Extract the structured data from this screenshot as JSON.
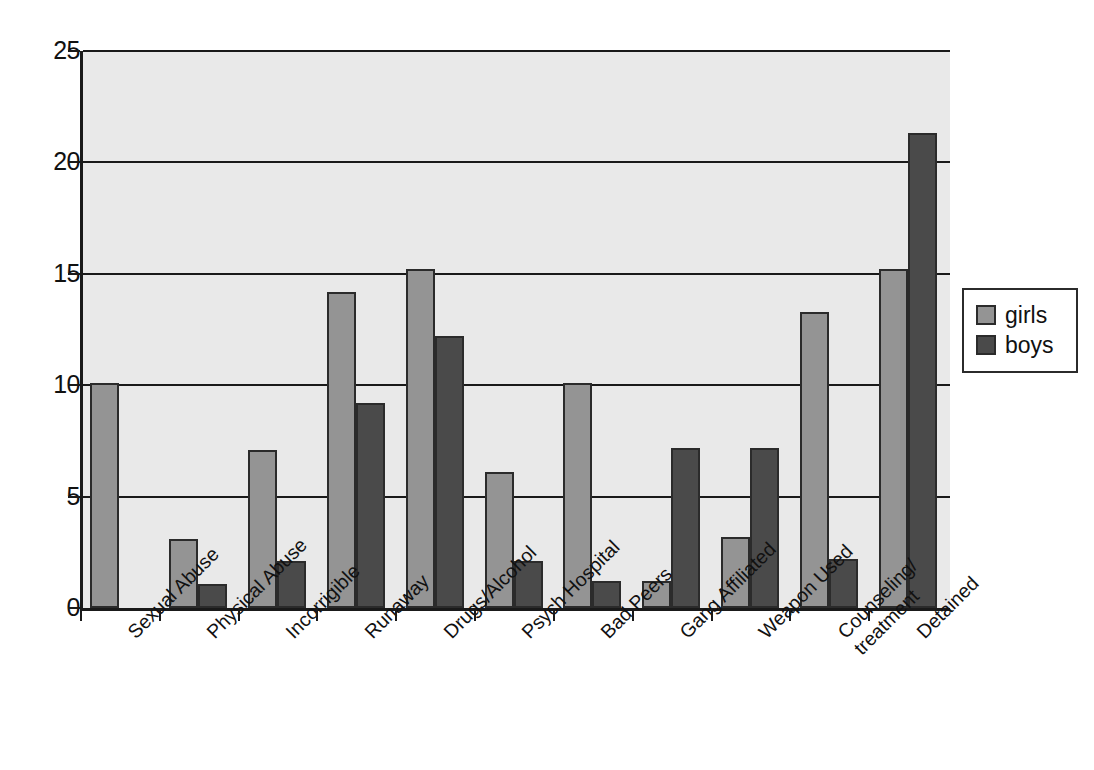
{
  "chart_data": {
    "type": "bar",
    "title": "",
    "subtitle": "",
    "xlabel": "",
    "ylabel": "",
    "ylim": [
      0,
      25
    ],
    "yticks": [
      0,
      5,
      10,
      15,
      20,
      25
    ],
    "grid": true,
    "grid_axis": "y",
    "legend_position": "right",
    "categories": [
      "Sexual Abuse",
      "Physical Abuse",
      "Incorrigible",
      "Runaway",
      "Drugs/Alcohol",
      "Psych Hospital",
      "Bad Peers",
      "Gang Affiliated",
      "Weapon Used",
      "Counseling/treatment",
      "Detained"
    ],
    "category_label_lines": [
      [
        "Sexual Abuse"
      ],
      [
        "Physical Abuse"
      ],
      [
        "Incorrigible"
      ],
      [
        "Runaway"
      ],
      [
        "Drugs/Alcohol"
      ],
      [
        "Psych Hospital"
      ],
      [
        "Bad Peers"
      ],
      [
        "Gang Affiliated"
      ],
      [
        "Weapon Used"
      ],
      [
        "Counseling/",
        "treatment"
      ],
      [
        "Detained"
      ]
    ],
    "series": [
      {
        "name": "girls",
        "color": "#949494",
        "values": [
          10.1,
          3.1,
          7.1,
          14.2,
          15.2,
          6.1,
          10.1,
          1.2,
          3.2,
          13.3,
          15.2
        ]
      },
      {
        "name": "boys",
        "color": "#4a4a4a",
        "values": [
          0,
          1.1,
          2.1,
          9.2,
          12.2,
          2.1,
          1.2,
          7.2,
          7.2,
          2.2,
          21.3
        ]
      }
    ]
  },
  "legend": {
    "items": [
      {
        "label": "girls",
        "key": "girls"
      },
      {
        "label": "boys",
        "key": "boys"
      }
    ]
  },
  "axis": {
    "y_tick_labels": [
      "25",
      "20",
      "15",
      "10",
      "5",
      "0"
    ]
  }
}
